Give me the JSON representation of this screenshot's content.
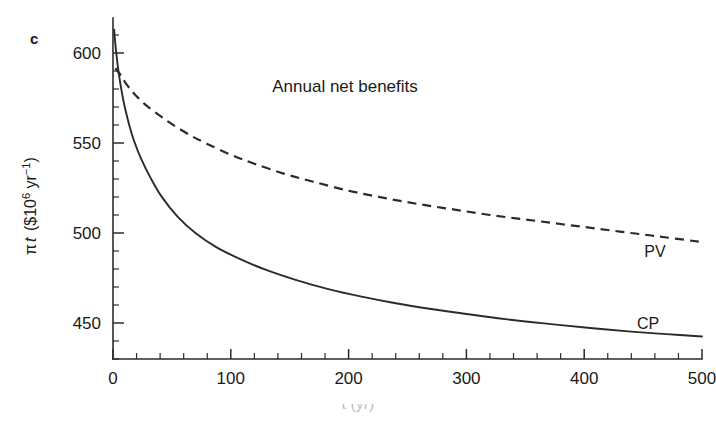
{
  "figure": {
    "panel_letter": "c",
    "background_color": "#ffffff",
    "ink_color": "#2b2b2b"
  },
  "chart_data": {
    "type": "line",
    "title": "",
    "annotation": "Annual net benefits",
    "xlabel": "t (yr)",
    "ylabel": "π t ($10⁶ yr⁻¹)",
    "ylabel_parts": {
      "symbol": "π",
      "variable": "t",
      "units_open": " ($10",
      "units_exp": "6",
      "units_mid": " yr",
      "units_exp2": "−1",
      "units_close": ")"
    },
    "xlim": [
      0,
      500
    ],
    "ylim": [
      430,
      615
    ],
    "xticks": [
      0,
      100,
      200,
      300,
      400,
      500
    ],
    "xtick_labels": [
      "0",
      "100",
      "200",
      "300",
      "400",
      "500"
    ],
    "x_minor_step": 20,
    "yticks": [
      450,
      500,
      550,
      600
    ],
    "ytick_labels": [
      "450",
      "500",
      "550",
      "600"
    ],
    "y_minor_step": 10,
    "grid": false,
    "legend_position": "inline-right",
    "series": [
      {
        "name": "PV",
        "style": "dashed",
        "label": "PV",
        "label_x": 470,
        "label_y": 497,
        "x": [
          2,
          5,
          8,
          10,
          14,
          20,
          28,
          38,
          50,
          65,
          80,
          100,
          120,
          145,
          170,
          200,
          230,
          260,
          290,
          320,
          350,
          380,
          410,
          440,
          470,
          500
        ],
        "y": [
          591.5,
          589.8,
          588.0,
          586.8,
          584.6,
          581.5,
          577.8,
          573.8,
          569.6,
          565.0,
          560.9,
          556.2,
          552.0,
          547.4,
          543.4,
          539.0,
          535.1,
          531.6,
          528.5,
          525.6,
          523.0,
          520.6,
          518.4,
          516.4,
          514.5,
          512.8
        ]
      },
      {
        "name": "CP",
        "style": "solid",
        "label": "CP",
        "label_x": 462,
        "label_y": 452,
        "x": [
          1,
          2,
          4,
          6,
          8,
          10,
          14,
          18,
          24,
          32,
          42,
          55,
          70,
          88,
          108,
          130,
          155,
          182,
          210,
          240,
          270,
          300,
          335,
          370,
          405,
          440,
          470,
          500
        ],
        "y": [
          613.0,
          606.0,
          596.0,
          588.5,
          582.2,
          576.8,
          568.0,
          561.0,
          552.8,
          544.6,
          536.2,
          528.0,
          520.8,
          514.4,
          509.0,
          504.4,
          500.2,
          496.6,
          493.6,
          490.8,
          488.5,
          486.5,
          484.5,
          482.8,
          481.4,
          480.2,
          479.3,
          478.5
        ]
      }
    ],
    "series_note": "PV curve values span roughly 592 down to 476; CP curve spans roughly 613 down to 437 (plotted positions use calibrated axis mapping)"
  },
  "series_plot": {
    "pv_values": [
      591.5,
      589.0,
      586.5,
      584.0,
      580.5,
      576.0,
      571.0,
      566.0,
      560.5,
      554.5,
      549.5,
      543.5,
      538.5,
      533.0,
      528.5,
      523.5,
      519.5,
      516.0,
      513.0,
      510.0,
      507.5,
      505.0,
      502.5,
      500.0,
      497.5,
      495.0
    ],
    "cp_values": [
      613.0,
      605.0,
      593.0,
      584.0,
      576.5,
      570.0,
      559.5,
      551.0,
      541.0,
      530.5,
      519.5,
      509.0,
      500.0,
      492.0,
      485.5,
      479.5,
      474.0,
      469.0,
      464.8,
      461.0,
      457.8,
      455.0,
      452.0,
      449.5,
      447.2,
      445.2,
      443.8,
      442.5
    ]
  },
  "labels": {
    "annotation": "Annual net benefits",
    "pv": "PV",
    "cp": "CP",
    "xaxis_title": "t (yr)",
    "panel": "c"
  }
}
